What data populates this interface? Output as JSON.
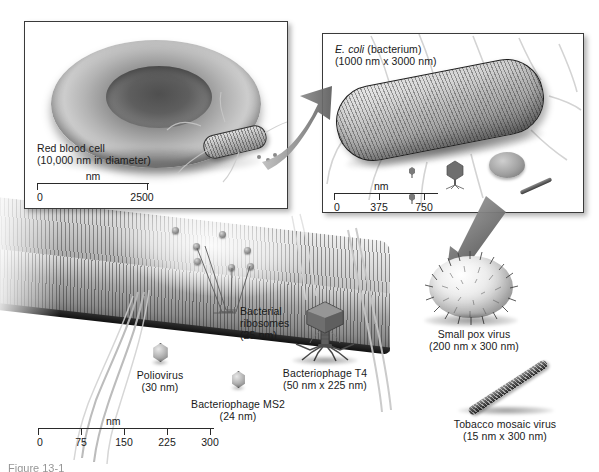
{
  "figure": {
    "caption_partial": "Figure 13-1"
  },
  "panels": {
    "red_blood_cell": {
      "name": "Red blood cell",
      "line1": "Red blood cell",
      "line2": "(10,000 nm in diameter)",
      "scale": {
        "unit": "nm",
        "ticks": [
          "0",
          "2500"
        ]
      }
    },
    "ecoli": {
      "name": "E. coli",
      "species_italic": "E. coli",
      "species_rest": " (bacterium)",
      "line2": "(1000 nm x 3000 nm)",
      "scale": {
        "unit": "nm",
        "ticks": [
          "0",
          "375",
          "750"
        ]
      }
    }
  },
  "main_scale": {
    "unit": "nm",
    "ticks": [
      "0",
      "75",
      "150",
      "225",
      "300"
    ]
  },
  "specimens": [
    {
      "id": "bacterial-ribosomes",
      "line1": "Bacterial",
      "line2": "ribosomes",
      "line3": "(25 nm)"
    },
    {
      "id": "poliovirus",
      "line1": "Poliovirus",
      "line2": "(30 nm)"
    },
    {
      "id": "bacteriophage-ms2",
      "line1": "Bacteriophage MS2",
      "line2": "(24 nm)"
    },
    {
      "id": "bacteriophage-t4",
      "line1": "Bacteriophage T4",
      "line2": "(50 nm x 225 nm)"
    },
    {
      "id": "small-pox-virus",
      "line1": "Small pox virus",
      "line2": "(200 nm x 300 nm)"
    },
    {
      "id": "tobacco-mosaic-virus",
      "line1": "Tobacco mosaic virus",
      "line2": "(15 nm x 300 nm)"
    }
  ],
  "colors": {
    "ink": "#1a1a1a",
    "panel_border": "#3a3a3a",
    "arrow": "#6e6e6e",
    "background": "#ffffff"
  }
}
